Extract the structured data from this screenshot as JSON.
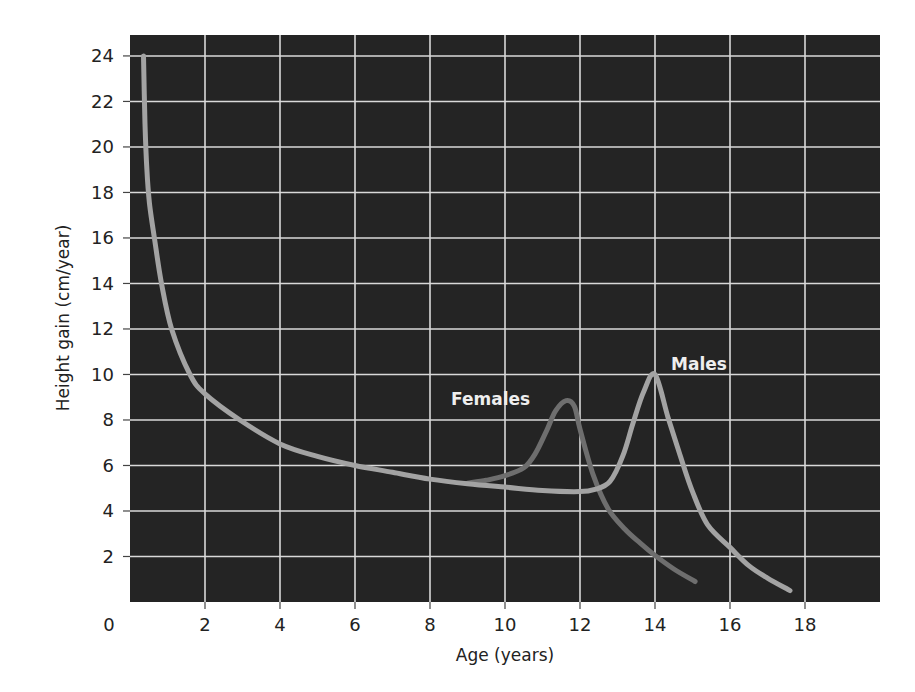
{
  "chart_data": {
    "type": "line",
    "title": "",
    "xlabel": "Age (years)",
    "ylabel": "Height gain (cm/year)",
    "xlim": [
      0,
      20
    ],
    "ylim": [
      0,
      24.92
    ],
    "grid": true,
    "legend_position": "inline labels",
    "x_ticks": [
      0,
      2,
      4,
      6,
      8,
      10,
      12,
      14,
      16,
      18
    ],
    "y_ticks": [
      2,
      4,
      6,
      8,
      10,
      12,
      14,
      16,
      18,
      20,
      22,
      24
    ],
    "x_tick_labels": [
      "0",
      "2",
      "4",
      "6",
      "8",
      "10",
      "12",
      "14",
      "16",
      "18"
    ],
    "y_tick_labels": [
      "2",
      "4",
      "6",
      "8",
      "10",
      "12",
      "14",
      "16",
      "18",
      "20",
      "22",
      "24"
    ],
    "series": [
      {
        "name": "Males",
        "color": "#a3a3a3",
        "label_position": {
          "x": 14.2,
          "y": 10.2
        },
        "points": [
          [
            0.36,
            24.0
          ],
          [
            0.4,
            21.0
          ],
          [
            0.45,
            19.0
          ],
          [
            0.52,
            17.5
          ],
          [
            0.65,
            16.0
          ],
          [
            0.84,
            14.0
          ],
          [
            1.11,
            12.0
          ],
          [
            1.6,
            10.0
          ],
          [
            2.0,
            9.15
          ],
          [
            2.93,
            8.0
          ],
          [
            4.0,
            6.95
          ],
          [
            5.0,
            6.4
          ],
          [
            6.0,
            6.0
          ],
          [
            7.0,
            5.7
          ],
          [
            8.0,
            5.4
          ],
          [
            9.0,
            5.2
          ],
          [
            10.0,
            5.05
          ],
          [
            11.0,
            4.9
          ],
          [
            12.0,
            4.85
          ],
          [
            12.4,
            4.95
          ],
          [
            12.8,
            5.3
          ],
          [
            13.15,
            6.45
          ],
          [
            13.42,
            7.9
          ],
          [
            13.7,
            9.25
          ],
          [
            14.0,
            10.0
          ],
          [
            14.35,
            8.1
          ],
          [
            14.67,
            6.45
          ],
          [
            15.0,
            4.85
          ],
          [
            15.4,
            3.4
          ],
          [
            16.0,
            2.4
          ],
          [
            16.5,
            1.6
          ],
          [
            17.0,
            1.05
          ],
          [
            17.6,
            0.5
          ]
        ]
      },
      {
        "name": "Females",
        "color": "#6e6e6e",
        "label_position": {
          "x": 8.55,
          "y": 8.5
        },
        "points": [
          [
            9.0,
            5.22
          ],
          [
            9.5,
            5.35
          ],
          [
            10.0,
            5.55
          ],
          [
            10.5,
            5.9
          ],
          [
            10.8,
            6.5
          ],
          [
            11.1,
            7.5
          ],
          [
            11.35,
            8.4
          ],
          [
            11.63,
            8.85
          ],
          [
            11.85,
            8.6
          ],
          [
            12.0,
            7.6
          ],
          [
            12.35,
            5.6
          ],
          [
            12.75,
            4.1
          ],
          [
            13.2,
            3.2
          ],
          [
            13.6,
            2.6
          ],
          [
            14.0,
            2.05
          ],
          [
            14.5,
            1.45
          ],
          [
            15.07,
            0.9
          ]
        ]
      }
    ]
  },
  "style": {
    "plot_background": "#242424",
    "grid_color": "#d9d9d9",
    "axis_text_color": "#222222",
    "label_text_color": "#eeeeee"
  },
  "labels": {
    "x_axis_title": "Age (years)",
    "y_axis_title": "Height gain (cm/year)",
    "origin_label": "0",
    "males": "Males",
    "females": "Females"
  }
}
